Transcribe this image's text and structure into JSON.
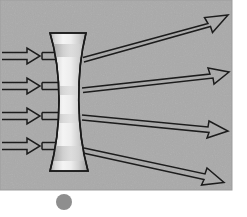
{
  "figure": {
    "canvas": {
      "width": 247,
      "height": 217
    },
    "background_color": "#ffffff",
    "panel": {
      "name": "gray-panel",
      "x": 0,
      "y": 0,
      "width": 232,
      "height": 190,
      "fill_color": "#aaaaaa",
      "noise": true
    },
    "lens": {
      "type": "biconcave",
      "label": "",
      "outline_color": "#1a1a1a",
      "outline_width": 1.6,
      "top_y": 33,
      "bottom_y": 171,
      "top_left_x": 50,
      "top_right_x": 86,
      "bottom_left_x": 50,
      "bottom_right_x": 88,
      "waist_left_x": 63,
      "waist_right_x": 75,
      "fill_light": "#f2f2f2",
      "fill_mid": "#d8d8d8",
      "fill_dark": "#9e9e9e"
    },
    "incoming_rays": {
      "count": 4,
      "color": "#1a1a1a",
      "style": "hollow-outline-arrow",
      "start_x": 2,
      "arrowhead_x": 40,
      "end_x": 57,
      "y_positions": [
        56,
        86,
        116,
        146
      ]
    },
    "outgoing_rays": {
      "count": 4,
      "color": "#1a1a1a",
      "style": "hollow-outline-arrow",
      "items": [
        {
          "name": "outgoing-ray-1",
          "x1": 83,
          "y1": 55,
          "x2": 228,
          "y2": 15
        },
        {
          "name": "outgoing-ray-2",
          "x1": 82,
          "y1": 87,
          "x2": 229,
          "y2": 72
        },
        {
          "name": "outgoing-ray-3",
          "x1": 82,
          "y1": 116,
          "x2": 228,
          "y2": 131
        },
        {
          "name": "outgoing-ray-4",
          "x1": 84,
          "y1": 148,
          "x2": 224,
          "y2": 182
        }
      ]
    },
    "dot": {
      "name": "gray-dot",
      "cx": 64,
      "cy": 202,
      "r": 8,
      "fill_color": "#8e8e8e"
    }
  }
}
